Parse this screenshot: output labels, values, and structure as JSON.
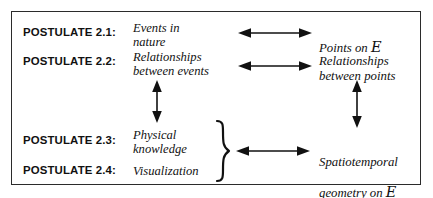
{
  "figure": {
    "background_color": "#ffffff",
    "border_color": "#2b2b2b",
    "ink_color": "#111111"
  },
  "rows": [
    {
      "label": "POSTULATE 2.1:",
      "left_text": "Events in\nnature",
      "right_text": "Points on ",
      "right_symbol": "E"
    },
    {
      "label": "POSTULATE 2.2:",
      "left_text": "Relationships\nbetween events",
      "right_text": "Relationships\nbetween points",
      "right_symbol": ""
    },
    {
      "label": "POSTULATE 2.3:",
      "left_text": "Physical\nknowledge",
      "right_text": "",
      "right_symbol": ""
    },
    {
      "label": "POSTULATE 2.4:",
      "left_text": "Visualization",
      "right_text": "",
      "right_symbol": ""
    }
  ],
  "grouped_right": {
    "text_line1": "Spatiotemporal",
    "text_line2": "geometry on ",
    "symbol": "E"
  },
  "connectors": {
    "horizontal_top": "double-headed-horizontal-arrow",
    "horizontal_second": "double-headed-horizontal-arrow",
    "horizontal_bottom": "double-headed-horizontal-arrow",
    "vertical_left": "double-headed-vertical-arrow",
    "vertical_right": "double-headed-vertical-arrow",
    "group_brace": "right-curly-brace"
  }
}
